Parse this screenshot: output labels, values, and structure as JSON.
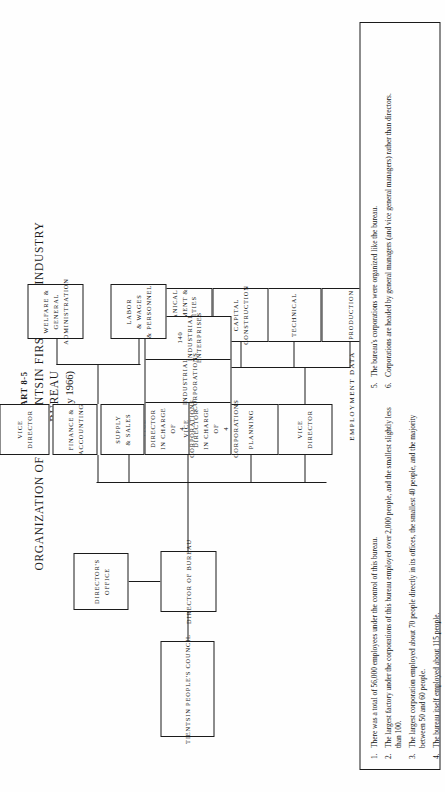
{
  "title": {
    "chart_number": "CHART 8-5",
    "chart_title_line1": "ORGANIZATION OF THE TIENTSIN FIRST LIGHT-INDUSTRY",
    "chart_title_line2": "BUREAU",
    "date": "(May 1966)"
  },
  "boxes": {
    "council": {
      "line1": "TIENTSIN PEOPLE'S COUNCIL"
    },
    "director_bureau": {
      "line1": "DIRECTOR OF BUREAU"
    },
    "directors_office": {
      "line1": "DIRECTOR'S",
      "line2": "OFFICE"
    },
    "vice_director_left": {
      "line1": "VICE",
      "line2": "DIRECTOR"
    },
    "planning": {
      "line1": "PLANNING"
    },
    "production": {
      "line1": "PRODUCTION"
    },
    "technical": {
      "line1": "TECHNICAL"
    },
    "capital_construction": {
      "line1": "CAPITAL",
      "line2": "CONSTRUCTION"
    },
    "mechanical": {
      "line1": "MECHANICAL",
      "line2": "EQUIPMENT &",
      "line3": "UTILITIES"
    },
    "vice_director_corp_a": {
      "line1": "VICE DIRECTOR",
      "line2": "IN CHARGE OF",
      "line3": "4 CORPORATIONS"
    },
    "vice_director_corp_b": {
      "line1": "VICE DIRECTOR",
      "line2": "IN CHARGE OF",
      "line3": "4 CORPORATIONS"
    },
    "industrial_corporations": {
      "line1": "INDUSTRIAL CORPORATIONS"
    },
    "industrial_enterprises": {
      "line1": "140 INDUSTRIAL ENTERPRISES"
    },
    "supply_sales": {
      "line1": "SUPPLY",
      "line2": "& SALES"
    },
    "finance_accounting": {
      "line1": "FINANCE &",
      "line2": "ACCOUNTING"
    },
    "vice_director_right": {
      "line1": "VICE",
      "line2": "DIRECTOR"
    },
    "labor_wages": {
      "line1": "LABOR",
      "line2": "& WAGES",
      "line3": "& PERSONNEL"
    },
    "welfare_general": {
      "line1": "WELFARE &",
      "line2": "GENERAL",
      "line3": "ADMINISTRATION"
    }
  },
  "employment_data": {
    "heading": "EMPLOYMENT DATA",
    "notes": [
      {
        "num": "1.",
        "text": "There was a total of 56,000 employees under the control of this bureau."
      },
      {
        "num": "2.",
        "text": "The largest factory under the corporations of this bureau employed over 2,000 people, and the smallest slightly less than 100."
      },
      {
        "num": "3.",
        "text": "The largest corporation employed about 70 people directly in its offices, the smallest 40 people, and the majority between 50 and 60 people."
      },
      {
        "num": "4.",
        "text": "The bureau itself employed about 115 people."
      },
      {
        "num": "5.",
        "text": "The bureau's corporations were organized like the bureau."
      },
      {
        "num": "6.",
        "text": "Corporations are headed by general managers (and vice general managers) rather than directors."
      }
    ]
  }
}
